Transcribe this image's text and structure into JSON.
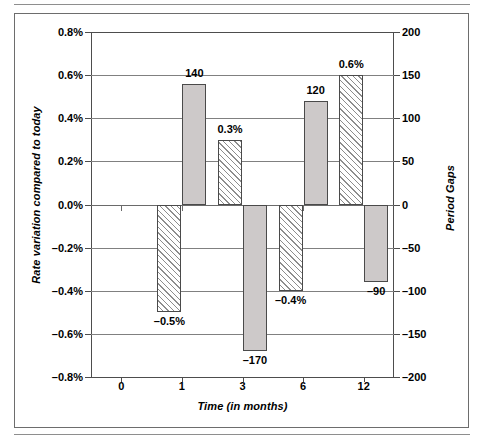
{
  "figure": {
    "frame_color": "#6d6d6d",
    "series_solid_color": "#cdc9c9",
    "series_hatch_color": "#8d8d8d"
  },
  "chart_data": {
    "type": "bar",
    "title": "",
    "xlabel": "Time (in months)",
    "ylabel": "Rate variation compared to today",
    "y2label": "Period Gaps",
    "categories": [
      "0",
      "1",
      "3",
      "6",
      "12"
    ],
    "x_tick_labels": [
      "0",
      "1",
      "3",
      "6",
      "12"
    ],
    "ylim": [
      -0.8,
      0.8
    ],
    "y_tick_labels": [
      "0.8%",
      "0.6%",
      "0.4%",
      "0.2%",
      "0.0%",
      "-0.2%",
      "-0.4%",
      "-0.6%",
      "-0.8%"
    ],
    "y_tick_values": [
      0.8,
      0.6,
      0.4,
      0.2,
      0.0,
      -0.2,
      -0.4,
      -0.6,
      -0.8
    ],
    "y2lim": [
      -200,
      200
    ],
    "y2_tick_labels": [
      "200",
      "150",
      "100",
      "50",
      "0",
      "-50",
      "-100",
      "-150",
      "-200"
    ],
    "y2_tick_values": [
      200,
      150,
      100,
      50,
      0,
      -50,
      -100,
      -150,
      -200
    ],
    "grid": true,
    "legend": "none",
    "series": [
      {
        "name": "Rate variation compared to today",
        "axis": "left",
        "style": "hatched",
        "categories": [
          "0",
          "1",
          "3",
          "6",
          "12"
        ],
        "values": [
          null,
          -0.5,
          0.3,
          -0.4,
          0.6
        ],
        "data_labels": [
          "",
          "-0.5%",
          "0.3%",
          "-0.4%",
          "0.6%"
        ]
      },
      {
        "name": "Period Gaps",
        "axis": "right",
        "style": "solid",
        "categories": [
          "0",
          "1",
          "3",
          "6",
          "12"
        ],
        "values": [
          null,
          140,
          -170,
          120,
          -90
        ],
        "data_labels": [
          "",
          "140",
          "-170",
          "120",
          "-90"
        ]
      }
    ],
    "annotations": [
      {
        "text": "140",
        "category": "1",
        "series": "Period Gaps"
      },
      {
        "text": "-0.5%",
        "category": "1",
        "series": "Rate variation compared to today"
      },
      {
        "text": "0.3%",
        "category": "3",
        "series": "Rate variation compared to today"
      },
      {
        "text": "-170",
        "category": "3",
        "series": "Period Gaps"
      },
      {
        "text": "120",
        "category": "6",
        "series": "Period Gaps"
      },
      {
        "text": "-0.4%",
        "category": "6",
        "series": "Rate variation compared to today"
      },
      {
        "text": "0.6%",
        "category": "12",
        "series": "Rate variation compared to today"
      },
      {
        "text": "-90",
        "category": "12",
        "series": "Period Gaps"
      }
    ]
  }
}
